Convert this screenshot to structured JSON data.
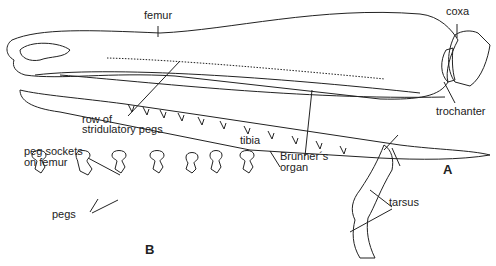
{
  "figure": {
    "panel_a_letter": "A",
    "panel_b_letter": "B",
    "labels": {
      "femur": "femur",
      "coxa": "coxa",
      "trochanter": "trochanter",
      "row_of": "row of",
      "stridulatory_pegs": "stridulatory pegs",
      "tibia": "tibia",
      "brunners": "Brunner´s",
      "organ": "organ",
      "tarsus": "tarsus",
      "peg_sockets": "peg sockets",
      "on_femur": "on femur",
      "pegs": "pegs"
    }
  }
}
